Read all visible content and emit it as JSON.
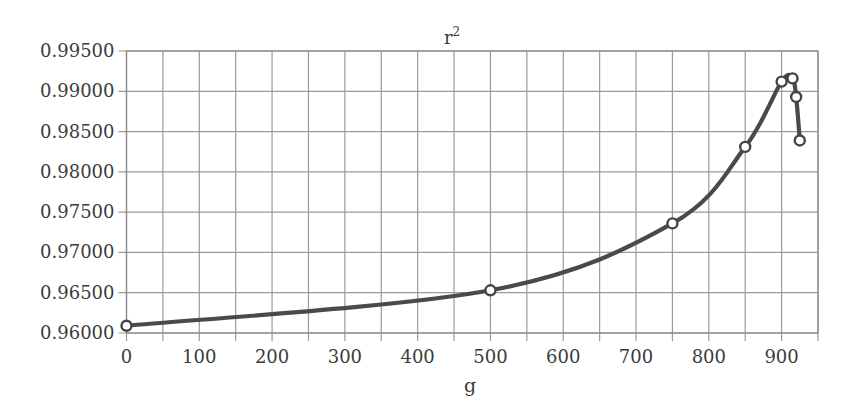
{
  "chart_data": {
    "type": "line",
    "title_base": "r",
    "title_sup": "2",
    "xlabel": "g",
    "ylabel": "",
    "xlim": [
      0,
      950
    ],
    "ylim": [
      0.96,
      0.995
    ],
    "grid": true,
    "legend": null,
    "x_ticks": [
      0,
      100,
      200,
      300,
      400,
      500,
      600,
      700,
      800,
      900
    ],
    "x_tick_labels": [
      "0",
      "100",
      "200",
      "300",
      "400",
      "500",
      "600",
      "700",
      "800",
      "900"
    ],
    "x_gridlines_every": 50,
    "y_ticks": [
      0.96,
      0.965,
      0.97,
      0.975,
      0.98,
      0.985,
      0.99,
      0.995
    ],
    "y_tick_labels": [
      "0.96000",
      "0.96500",
      "0.97000",
      "0.97500",
      "0.98000",
      "0.98500",
      "0.99000",
      "0.99500"
    ],
    "series": [
      {
        "name": "r²",
        "marker": "open-circle",
        "line": "smooth",
        "color": "#4a4a4a",
        "x": [
          0,
          500,
          750,
          850,
          900,
          915,
          920,
          925
        ],
        "values": [
          0.9609,
          0.9653,
          0.9736,
          0.9831,
          0.9912,
          0.9916,
          0.9893,
          0.9839
        ]
      }
    ]
  },
  "colors": {
    "line": "#4a4a4a",
    "marker_fill": "#ffffff",
    "grid": "#9a9a9a",
    "text": "#3a3a3a",
    "background": "#ffffff"
  }
}
